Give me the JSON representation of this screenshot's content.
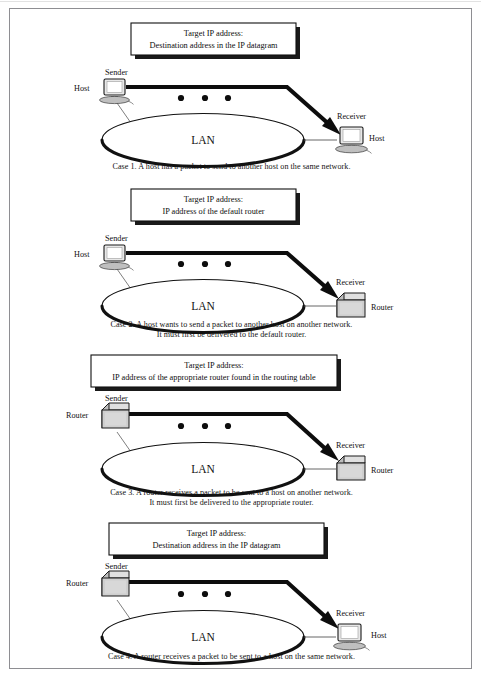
{
  "figure": {
    "lan_label": "LAN",
    "sender_label": "Sender",
    "receiver_label": "Receiver",
    "host_label": "Host",
    "router_label": "Router",
    "target_line1": "Target IP address:",
    "ellipsis_dots": 3
  },
  "colors": {
    "frame": "#8e8e92",
    "ink": "#111111",
    "shadow": "#1a1a1a",
    "device_fill": "#d4d4d4",
    "device_fill_light": "#e8e8e8",
    "white": "#ffffff"
  },
  "cases": [
    {
      "id": "case-1",
      "box_line1": "Target IP address:",
      "box_line2": "Destination address in the IP datagram",
      "sender_label": "Sender",
      "sender_side_label": "Host",
      "sender_type": "host",
      "receiver_label": "Receiver",
      "receiver_side_label": "Host",
      "receiver_type": "host",
      "lan_label": "LAN",
      "caption": "Case 1.  A host has a packet to send to another host on the same network.",
      "caption_line2": ""
    },
    {
      "id": "case-2",
      "box_line1": "Target IP address:",
      "box_line2": "IP address of the default  router",
      "sender_label": "Sender",
      "sender_side_label": "Host",
      "sender_type": "host",
      "receiver_label": "Receiver",
      "receiver_side_label": "Router",
      "receiver_type": "router",
      "lan_label": "LAN",
      "caption": "Case 2. A host wants to send a packet to another host on another network.",
      "caption_line2": "It must first be delivered to the default router."
    },
    {
      "id": "case-3",
      "box_line1": "Target IP address:",
      "box_line2": "IP address of the appropriate router found in the routing table",
      "sender_label": "Sender",
      "sender_side_label": "Router",
      "sender_type": "router",
      "receiver_label": "Receiver",
      "receiver_side_label": "Router",
      "receiver_type": "router",
      "lan_label": "LAN",
      "caption": "Case 3. A router receives a packet  to be sent to a host on another network.",
      "caption_line2": "It must first be delivered to the appropriate  router."
    },
    {
      "id": "case-4",
      "box_line1": "Target IP address:",
      "box_line2": "Destination address in the IP datagram",
      "sender_label": "Sender",
      "sender_side_label": "Router",
      "sender_type": "router",
      "receiver_label": "Receiver",
      "receiver_side_label": "Host",
      "receiver_type": "host",
      "lan_label": "LAN",
      "caption": "Case 4.  A router receives a packet  to be sent to a host on the same network.",
      "caption_line2": ""
    }
  ]
}
